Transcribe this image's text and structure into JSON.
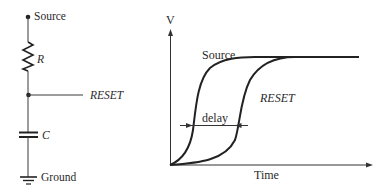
{
  "circuit": {
    "source_label": "Source",
    "resistor_label": "R",
    "reset_label": "RESET",
    "capacitor_label": "C",
    "ground_label": "Ground"
  },
  "graph": {
    "y_axis_label": "V",
    "x_axis_label": "Time",
    "source_curve_label": "Source",
    "reset_curve_label": "RESET",
    "delay_label": "delay"
  },
  "colors": {
    "ink": "#2a2a2a",
    "background": "#ffffff"
  }
}
